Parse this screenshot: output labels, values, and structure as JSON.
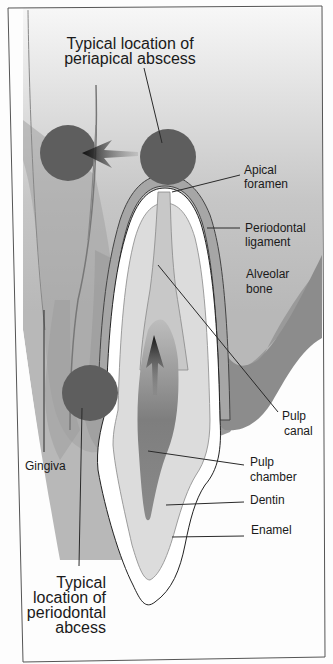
{
  "diagram": {
    "labels": {
      "periapical_line1": "Typical location of",
      "periapical_line2": "periapical abscess",
      "apical_foramen_1": "Apical",
      "apical_foramen_2": "foramen",
      "periodontal_ligament_1": "Periodontal",
      "periodontal_ligament_2": "ligament",
      "alveolar_bone_1": "Alveolar",
      "alveolar_bone_2": "bone",
      "pulp_canal_1": "Pulp",
      "pulp_canal_2": "canal",
      "pulp_chamber_1": "Pulp",
      "pulp_chamber_2": "chamber",
      "dentin": "Dentin",
      "enamel": "Enamel",
      "gingiva": "Gingiva",
      "periodontal_abscess_1": "Typical",
      "periodontal_abscess_2": "location of",
      "periodontal_abscess_3": "periodontal",
      "periodontal_abscess_4": "abcess"
    },
    "colors": {
      "abscess": "#5e5e5e",
      "bone": "#a8a8a8",
      "gum": "#8f8f8f",
      "dentin": "#dcdcdc",
      "enamel": "#ffffff",
      "pulp": "#8a8a8a",
      "background_top": "#f2f2f2",
      "background_mid": "#c4c4c4"
    }
  }
}
